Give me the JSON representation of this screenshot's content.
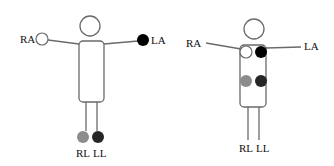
{
  "diagram": {
    "type": "electrode-placement",
    "colors": {
      "outline": "#6a6a6a",
      "ra": "#ffffff",
      "la": "#000000",
      "rl": "#8c8c8c",
      "ll": "#262626",
      "text": "#111111"
    },
    "figures": [
      {
        "name": "limb-placement",
        "labels": {
          "ra": "RA",
          "la": "LA",
          "rl": "RL",
          "ll": "LL"
        }
      },
      {
        "name": "torso-placement",
        "labels": {
          "ra": "RA",
          "la": "LA",
          "rl": "RL",
          "ll": "LL"
        }
      }
    ]
  }
}
